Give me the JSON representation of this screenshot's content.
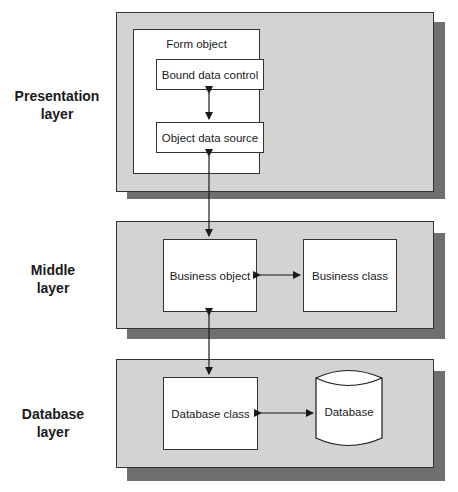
{
  "diagram": {
    "layers": [
      {
        "label_line1": "Presentation",
        "label_line2": "layer"
      },
      {
        "label_line1": "Middle",
        "label_line2": "layer"
      },
      {
        "label_line1": "Database",
        "label_line2": "layer"
      }
    ],
    "presentation": {
      "container_title": "Form object",
      "boxes": [
        "Bound data control",
        "Object data source"
      ]
    },
    "middle": {
      "boxes": [
        "Business object",
        "Business class"
      ]
    },
    "database": {
      "boxes": [
        "Database class"
      ],
      "cylinder": "Database"
    },
    "colors": {
      "layer_fill": "#d3d3d3",
      "shadow_fill": "#6f6f6f",
      "box_fill": "#ffffff",
      "stroke": "#333333"
    }
  }
}
